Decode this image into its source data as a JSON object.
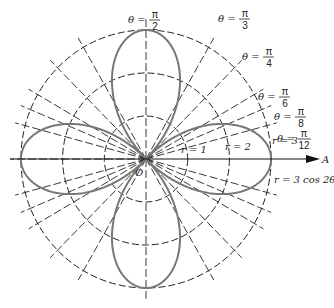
{
  "diagram": {
    "center": {
      "x": 146,
      "y": 159
    },
    "scale": {
      "rx": 41.7,
      "ry": 43
    },
    "circles": [
      {
        "r": 1,
        "label": "r = 1"
      },
      {
        "r": 2,
        "label": "r = 2"
      },
      {
        "r": 3,
        "label": "r = 3"
      }
    ],
    "rays": [
      {
        "label_num": "π",
        "label_den": "2",
        "angle_deg": 90
      },
      {
        "label_num": "π",
        "label_den": "3",
        "angle_deg": 60
      },
      {
        "label_num": "π",
        "label_den": "4",
        "angle_deg": 45
      },
      {
        "label_num": "π",
        "label_den": "6",
        "angle_deg": 30
      },
      {
        "label_num": "π",
        "label_den": "8",
        "angle_deg": 22.5
      },
      {
        "label_num": "π",
        "label_den": "12",
        "angle_deg": 15
      }
    ],
    "theta_symbol": "θ =",
    "curve": {
      "label": "r = 3 cos 2θ",
      "color": "#777777"
    },
    "polar_axis_label": "A",
    "origin_label": "O",
    "grid_color": "#222222"
  }
}
